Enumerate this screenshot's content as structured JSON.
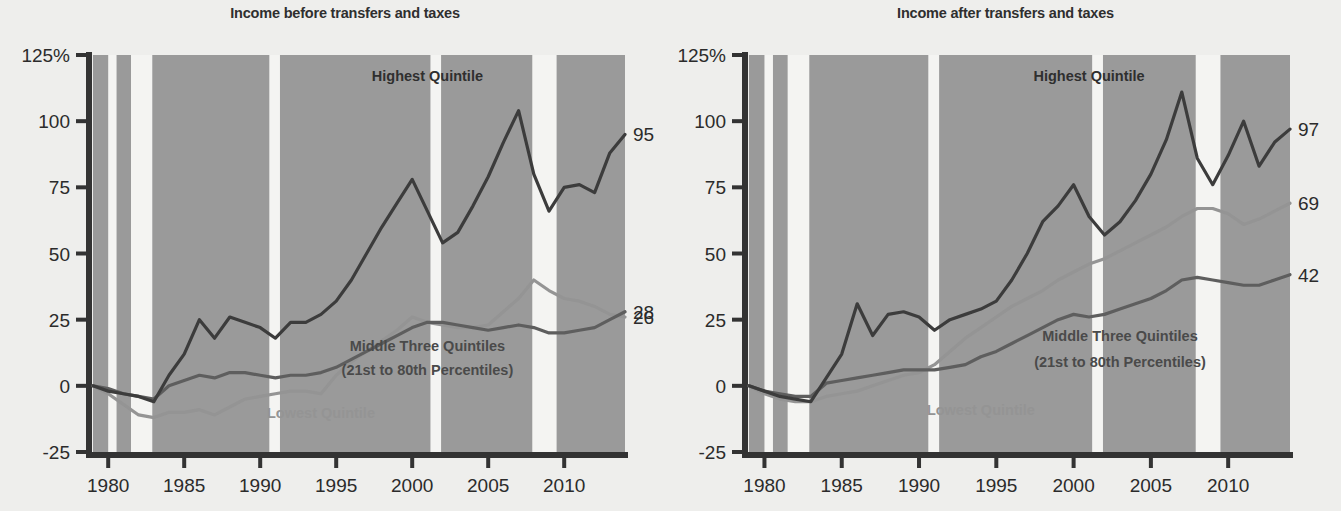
{
  "figure": {
    "background": "#eeeeec",
    "band_color": "#9a9a9a",
    "band_gap_color": "#f4f4f2",
    "axis_color": "#333333"
  },
  "colors": {
    "highest": "#3c3c3c",
    "middle": "#5e5e5e",
    "lowest": "#949494"
  },
  "chart_data": [
    {
      "type": "line",
      "title": "Income before transfers and taxes",
      "xlabel": "",
      "ylabel": "",
      "xlim": [
        1979,
        2014
      ],
      "ylim": [
        -25,
        125
      ],
      "xticks": [
        1980,
        1985,
        1990,
        1995,
        2000,
        2005,
        2010
      ],
      "yticks": [
        -25,
        0,
        25,
        50,
        75,
        100,
        125
      ],
      "ytick_labels": [
        "-25",
        "0",
        "25",
        "50",
        "75",
        "100",
        "125%"
      ],
      "grid": false,
      "legend": "inline-annotations",
      "x": [
        1979,
        1980,
        1981,
        1982,
        1983,
        1984,
        1985,
        1986,
        1987,
        1988,
        1989,
        1990,
        1991,
        1992,
        1993,
        1994,
        1995,
        1996,
        1997,
        1998,
        1999,
        2000,
        2001,
        2002,
        2003,
        2004,
        2005,
        2006,
        2007,
        2008,
        2009,
        2010,
        2011,
        2012,
        2013,
        2014
      ],
      "series": [
        {
          "name": "Highest Quintile",
          "color": "#3c3c3c",
          "end_value": 95,
          "end_label": "95",
          "values": [
            0,
            -2,
            -3,
            -4,
            -6,
            4,
            12,
            25,
            18,
            26,
            24,
            22,
            18,
            24,
            24,
            27,
            32,
            40,
            50,
            60,
            69,
            78,
            66,
            54,
            58,
            68,
            79,
            92,
            104,
            80,
            66,
            75,
            76,
            73,
            88,
            95
          ]
        },
        {
          "name": "Middle Three Quintiles",
          "color": "#5e5e5e",
          "end_value": 28,
          "end_label": "28",
          "values": [
            0,
            -1,
            -3,
            -4,
            -5,
            0,
            2,
            4,
            3,
            5,
            5,
            4,
            3,
            4,
            4,
            5,
            7,
            10,
            13,
            16,
            19,
            22,
            24,
            24,
            23,
            22,
            21,
            22,
            23,
            22,
            20,
            20,
            21,
            22,
            25,
            28
          ]
        },
        {
          "name": "Lowest Quintile",
          "color": "#949494",
          "end_value": 26,
          "end_label": "26",
          "values": [
            0,
            -3,
            -7,
            -11,
            -12,
            -10,
            -10,
            -9,
            -11,
            -8,
            -5,
            -4,
            -3,
            -2,
            -2,
            -3,
            4,
            9,
            13,
            17,
            21,
            26,
            24,
            23,
            22,
            22,
            23,
            28,
            33,
            40,
            36,
            33,
            32,
            30,
            27,
            26
          ]
        }
      ],
      "annotations": [
        {
          "text": "Highest Quintile",
          "x": 2001,
          "y": 115,
          "color": "#2f2f2f"
        },
        {
          "text": "Middle Three Quintiles",
          "x": 2001,
          "y": 13,
          "color": "#4a4a4a"
        },
        {
          "text": "(21st to 80th Percentiles)",
          "x": 2001,
          "y": 4,
          "color": "#4a4a4a"
        },
        {
          "text": "Lowest Quintile",
          "x": 1994,
          "y": -12,
          "color": "#949494"
        }
      ],
      "recession_bands": [
        {
          "start": 1980.0,
          "end": 1980.55
        },
        {
          "start": 1981.5,
          "end": 1982.9
        },
        {
          "start": 1990.6,
          "end": 1991.3
        },
        {
          "start": 2001.2,
          "end": 2001.9
        },
        {
          "start": 2007.9,
          "end": 2009.5
        }
      ]
    },
    {
      "type": "line",
      "title": "Income after transfers and taxes",
      "xlabel": "",
      "ylabel": "",
      "xlim": [
        1979,
        2014
      ],
      "ylim": [
        -25,
        125
      ],
      "xticks": [
        1980,
        1985,
        1990,
        1995,
        2000,
        2005,
        2010
      ],
      "yticks": [
        -25,
        0,
        25,
        50,
        75,
        100,
        125
      ],
      "ytick_labels": [
        "-25",
        "0",
        "25",
        "50",
        "75",
        "100",
        "125%"
      ],
      "grid": false,
      "legend": "inline-annotations",
      "x": [
        1979,
        1980,
        1981,
        1982,
        1983,
        1984,
        1985,
        1986,
        1987,
        1988,
        1989,
        1990,
        1991,
        1992,
        1993,
        1994,
        1995,
        1996,
        1997,
        1998,
        1999,
        2000,
        2001,
        2002,
        2003,
        2004,
        2005,
        2006,
        2007,
        2008,
        2009,
        2010,
        2011,
        2012,
        2013,
        2014
      ],
      "series": [
        {
          "name": "Highest Quintile",
          "color": "#3c3c3c",
          "end_value": 97,
          "end_label": "97",
          "values": [
            0,
            -2,
            -4,
            -5,
            -6,
            3,
            12,
            31,
            19,
            27,
            28,
            26,
            21,
            25,
            27,
            29,
            32,
            40,
            50,
            62,
            68,
            76,
            64,
            57,
            62,
            70,
            80,
            93,
            111,
            86,
            76,
            87,
            100,
            83,
            92,
            97
          ]
        },
        {
          "name": "Middle Three Quintiles",
          "color": "#5e5e5e",
          "end_value": 42,
          "end_label": "42",
          "values": [
            0,
            -2,
            -3,
            -4,
            -4,
            1,
            2,
            3,
            4,
            5,
            6,
            6,
            6,
            7,
            8,
            11,
            13,
            16,
            19,
            22,
            25,
            27,
            26,
            27,
            29,
            31,
            33,
            36,
            40,
            41,
            40,
            39,
            38,
            38,
            40,
            42
          ]
        },
        {
          "name": "Lowest Quintile",
          "color": "#949494",
          "end_value": 69,
          "end_label": "69",
          "values": [
            0,
            -3,
            -5,
            -6,
            -6,
            -4,
            -3,
            -2,
            0,
            2,
            4,
            5,
            8,
            13,
            18,
            22,
            26,
            30,
            33,
            36,
            40,
            43,
            46,
            48,
            51,
            54,
            57,
            60,
            64,
            67,
            67,
            65,
            61,
            63,
            66,
            69
          ]
        }
      ],
      "annotations": [
        {
          "text": "Highest Quintile",
          "x": 2001,
          "y": 115,
          "color": "#2f2f2f"
        },
        {
          "text": "Middle Three Quintiles",
          "x": 2003,
          "y": 17,
          "color": "#4a4a4a"
        },
        {
          "text": "(21st to 80th Percentiles)",
          "x": 2003,
          "y": 7,
          "color": "#4a4a4a"
        },
        {
          "text": "Lowest Quintile",
          "x": 1994,
          "y": -11,
          "color": "#949494"
        }
      ],
      "recession_bands": [
        {
          "start": 1980.0,
          "end": 1980.55
        },
        {
          "start": 1981.5,
          "end": 1982.9
        },
        {
          "start": 1990.6,
          "end": 1991.3
        },
        {
          "start": 2001.2,
          "end": 2001.9
        },
        {
          "start": 2007.9,
          "end": 2009.5
        }
      ]
    }
  ]
}
